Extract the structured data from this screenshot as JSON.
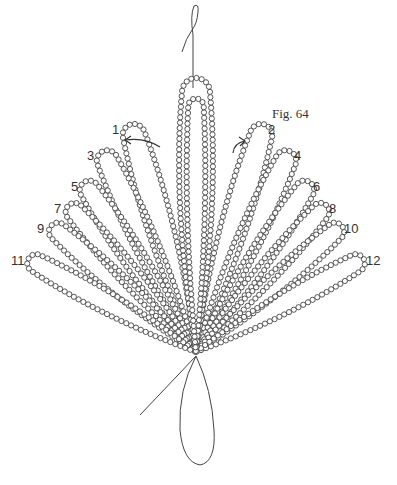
{
  "figure": {
    "title": "Fig. 64",
    "title_pos": [
      272,
      118
    ],
    "bead_radius": 2.6,
    "bead_color": "#444444",
    "thread_color": "#444444",
    "base_point": [
      196,
      352
    ],
    "center_petal": {
      "tip": [
        196,
        88
      ],
      "half_width": 20
    },
    "petals": [
      {
        "num": "1",
        "tip": [
          133,
          132
        ],
        "label_pos": [
          112,
          134
        ],
        "width": 16
      },
      {
        "num": "2",
        "tip": [
          262,
          132
        ],
        "label_pos": [
          268,
          134
        ],
        "width": 16
      },
      {
        "num": "3",
        "tip": [
          106,
          158
        ],
        "label_pos": [
          87,
          160
        ],
        "width": 15
      },
      {
        "num": "4",
        "tip": [
          287,
          158
        ],
        "label_pos": [
          294,
          160
        ],
        "width": 15
      },
      {
        "num": "5",
        "tip": [
          88,
          188
        ],
        "label_pos": [
          71,
          191
        ],
        "width": 14
      },
      {
        "num": "6",
        "tip": [
          306,
          188
        ],
        "label_pos": [
          313,
          191
        ],
        "width": 14
      },
      {
        "num": "7",
        "tip": [
          73,
          210
        ],
        "label_pos": [
          54,
          213
        ],
        "width": 13
      },
      {
        "num": "8",
        "tip": [
          322,
          210
        ],
        "label_pos": [
          329,
          213
        ],
        "width": 13
      },
      {
        "num": "9",
        "tip": [
          56,
          230
        ],
        "label_pos": [
          37,
          233
        ],
        "width": 13
      },
      {
        "num": "10",
        "tip": [
          337,
          230
        ],
        "label_pos": [
          344,
          233
        ],
        "width": 13
      },
      {
        "num": "11",
        "tip": [
          34,
          262
        ],
        "label_pos": [
          11,
          265
        ],
        "width": 13
      },
      {
        "num": "12",
        "tip": [
          358,
          262
        ],
        "label_pos": [
          366,
          265
        ],
        "width": 13
      }
    ],
    "arrows": [
      {
        "name": "left-arrow",
        "path": "M160,147 Q145,137 125,140",
        "head": [
          125,
          140
        ],
        "dir": "left"
      },
      {
        "name": "right-arrow",
        "path": "M233,153 Q234,143 245,141",
        "head": [
          245,
          141
        ],
        "dir": "right"
      }
    ]
  }
}
